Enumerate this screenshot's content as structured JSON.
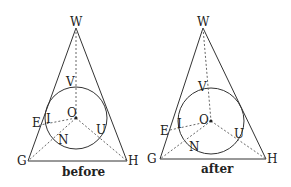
{
  "figures": [
    {
      "caption": "before",
      "labels": {
        "W": "W",
        "V": "V",
        "O": "O",
        "E": "E",
        "I": "I",
        "N": "N",
        "U": "U",
        "G": "G",
        "H": "H"
      }
    },
    {
      "caption": "after",
      "labels": {
        "W": "W",
        "V": "V",
        "O": "O",
        "E": "E",
        "I": "I",
        "N": "N",
        "U": "U",
        "G": "G",
        "H": "H"
      }
    }
  ],
  "colors": {
    "line": "#333333",
    "dashed": "#666666",
    "text": "#222222"
  }
}
